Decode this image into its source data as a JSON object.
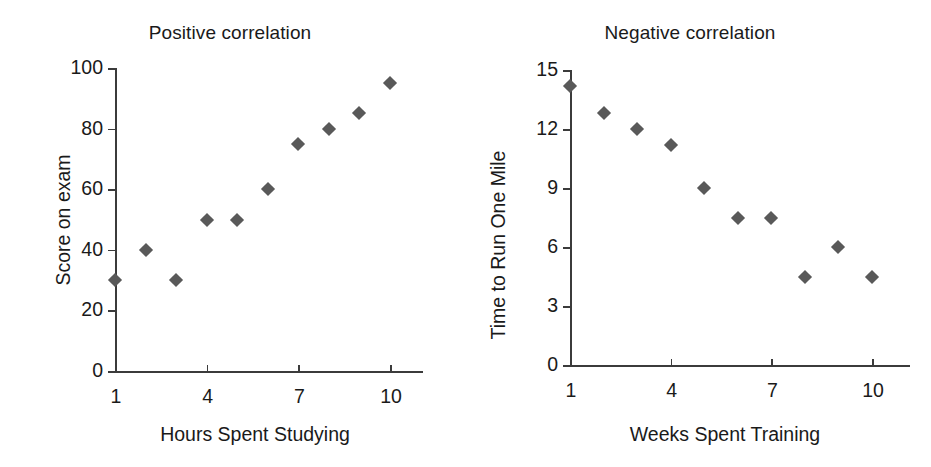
{
  "figure": {
    "background": "#ffffff",
    "marker_color": "#595959",
    "axis_color": "#3b3b3b",
    "text_color": "#1a1a1a",
    "marker_shape": "diamond"
  },
  "chart_data": [
    {
      "type": "scatter",
      "title": "Positive correlation",
      "xlabel": "Hours Spent Studying",
      "ylabel": "Score on exam",
      "x": [
        1,
        2,
        3,
        4,
        5,
        6,
        7,
        8,
        9,
        10
      ],
      "values": [
        30,
        40,
        30,
        50,
        50,
        60,
        75,
        80,
        85,
        95
      ],
      "xlim": [
        1,
        11
      ],
      "ylim": [
        0,
        100
      ],
      "xticks": [
        1,
        4,
        7,
        10
      ],
      "xticklabels": [
        "1",
        "4",
        "7",
        "10"
      ],
      "yticks": [
        0,
        20,
        40,
        60,
        80,
        100
      ],
      "yticklabels": [
        "0",
        "20",
        "40",
        "60",
        "80",
        "100"
      ],
      "grid": false,
      "legend": "none"
    },
    {
      "type": "scatter",
      "title": "Negative correlation",
      "xlabel": "Weeks Spent Training",
      "ylabel": "Time to Run One Mile",
      "x": [
        1,
        2,
        3,
        4,
        5,
        6,
        7,
        8,
        9,
        10
      ],
      "values": [
        14.2,
        12.8,
        12,
        11.2,
        9,
        7.5,
        7.5,
        4.5,
        6,
        4.5
      ],
      "xlim": [
        1,
        11.2
      ],
      "ylim": [
        0,
        15
      ],
      "xticks": [
        1,
        4,
        7,
        10
      ],
      "xticklabels": [
        "1",
        "4",
        "7",
        "10"
      ],
      "yticks": [
        0,
        3,
        6,
        9,
        12,
        15
      ],
      "yticklabels": [
        "0",
        "3",
        "6",
        "9",
        "12",
        "15"
      ],
      "grid": false,
      "legend": "none"
    }
  ]
}
